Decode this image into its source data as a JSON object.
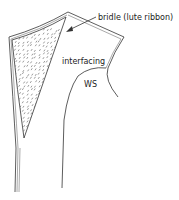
{
  "figure": {
    "labels": {
      "bridle": "bridle (lute ribbon)",
      "interfacing": "interfacing",
      "wrong_side": "WS"
    },
    "colors": {
      "ink": "#333333",
      "background": "#ffffff"
    }
  }
}
